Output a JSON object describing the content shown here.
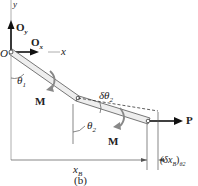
{
  "figure": {
    "caption": "(b)",
    "labels": {
      "y_axis": "y",
      "x_axis": "x",
      "origin": "O",
      "oy": "O",
      "oy_sub": "y",
      "ox": "O",
      "ox_sub": "x",
      "theta1": "θ",
      "theta1_sub": "1",
      "theta2": "θ",
      "theta2_sub": "2",
      "dtheta2": "δθ",
      "dtheta2_sub": "2",
      "moment1": "M",
      "moment2": "M",
      "force": "P",
      "xB": "x",
      "xB_sub": "B",
      "dxB": "(δx",
      "dxB_sub": "B",
      "dxB_close": ")",
      "dxB_sub2": "θ2"
    },
    "colors": {
      "line": "#333333",
      "member_fill": "#e8e8e8",
      "moment_arrow": "#888888"
    }
  }
}
